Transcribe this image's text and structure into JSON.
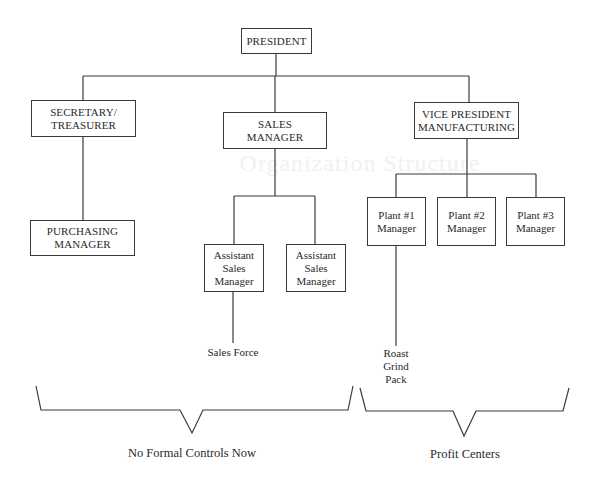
{
  "background_bleed": {
    "upper_text": "Organization Structure",
    "lower_text": ""
  },
  "org_chart": {
    "president": {
      "label": "PRESIDENT"
    },
    "secretary_treasurer": {
      "label": "SECRETARY/\nTREASURER"
    },
    "purchasing_manager": {
      "label": "PURCHASING\nMANAGER"
    },
    "sales_manager": {
      "label": "SALES\nMANAGER"
    },
    "assistant_sales_managers": [
      {
        "label": "Assistant\nSales\nManager"
      },
      {
        "label": "Assistant\nSales\nManager"
      }
    ],
    "sales_force": {
      "label": "Sales Force"
    },
    "vp_manufacturing": {
      "label": "VICE PRESIDENT\nMANUFACTURING"
    },
    "plant_managers": [
      {
        "label": "Plant #1\nManager"
      },
      {
        "label": "Plant #2\nManager"
      },
      {
        "label": "Plant #3\nManager"
      }
    ],
    "plant1_operations": {
      "label": "Roast\nGrind\nPack"
    }
  },
  "brackets": {
    "left_caption": "No Formal Controls Now",
    "right_caption": "Profit Centers"
  },
  "colors": {
    "line": "#3a3a3a",
    "background": "#ffffff",
    "text": "#2a2a2a"
  }
}
